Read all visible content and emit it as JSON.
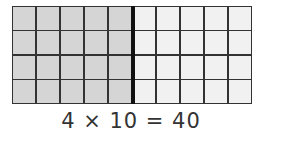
{
  "diagram": {
    "type": "area-model-grid",
    "rows": 4,
    "columns": 10,
    "shaded_columns": 5,
    "colors": {
      "shaded": "#d5d5d5",
      "unshaded": "#f1f1f1",
      "grid_line": "#333333",
      "divider": "#111111"
    }
  },
  "equation": {
    "text": "4 × 10 = 40",
    "factor_a": 4,
    "factor_b": 10,
    "product": 40
  }
}
